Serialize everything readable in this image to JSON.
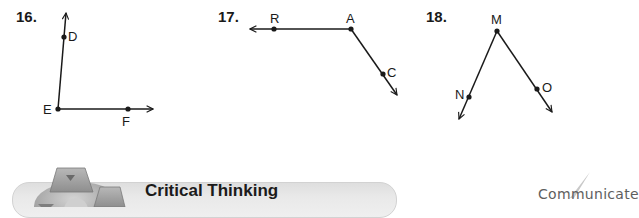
{
  "problems": [
    {
      "number": "16.",
      "vertex": "E",
      "rays": [
        {
          "through": "D",
          "direction": "up"
        },
        {
          "through": "F",
          "direction": "right"
        }
      ],
      "labels": [
        "D",
        "E",
        "F"
      ]
    },
    {
      "number": "17.",
      "vertex": "A",
      "rays": [
        {
          "through": "R",
          "direction": "left"
        },
        {
          "through": "C",
          "direction": "down-right"
        }
      ],
      "labels": [
        "R",
        "A",
        "C"
      ]
    },
    {
      "number": "18.",
      "vertex": "M",
      "rays": [
        {
          "through": "N",
          "direction": "down-left"
        },
        {
          "through": "O",
          "direction": "down-right"
        }
      ],
      "labels": [
        "M",
        "N",
        "O"
      ]
    }
  ],
  "section": {
    "title": "Critical Thinking",
    "icon": "geometric-solids-icon"
  },
  "margin_note": "Communicate",
  "colors": {
    "ink": "#1a1a1a",
    "banner": "#e6e6e6",
    "note": "#5e5e5e"
  }
}
